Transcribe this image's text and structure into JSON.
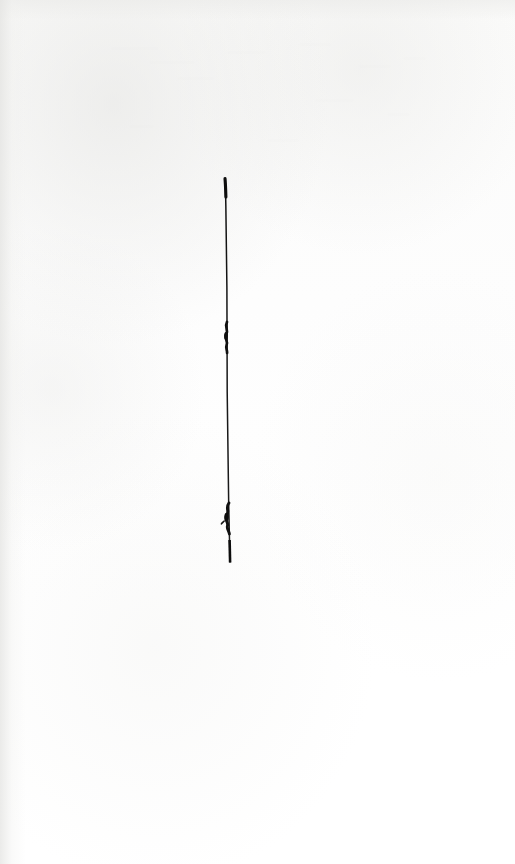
{
  "page": {
    "width_px": 515,
    "height_px": 864,
    "background_color": "#fdfdfc",
    "paper_tone": "off-white",
    "visible_text": ""
  },
  "artwork": {
    "name": "vertical-ink-stroke",
    "description": "A single near-vertical hand-drawn ink line",
    "ink_color": "#141414",
    "stroke": {
      "top_y": 178,
      "bottom_y": 563,
      "top_x": 225,
      "bottom_x": 230,
      "length_px": 385,
      "min_width_px": 1,
      "max_width_px": 3
    },
    "blobs": [
      {
        "name": "upper-ink-blob",
        "x": 226,
        "y": 328,
        "width_px": 6,
        "height_px": 26
      },
      {
        "name": "lower-ink-blob",
        "x": 228,
        "y": 512,
        "width_px": 7,
        "height_px": 24
      }
    ]
  },
  "showthrough": {
    "description": "Faint bleed-through from the reverse side of the sheet",
    "marks": [
      {
        "x": 112,
        "y": 44,
        "size_px": 7,
        "text": "—  ——   ———"
      },
      {
        "x": 150,
        "y": 58,
        "size_px": 7,
        "text": "————  ——"
      },
      {
        "x": 228,
        "y": 48,
        "size_px": 7,
        "text": "——  ———"
      },
      {
        "x": 300,
        "y": 40,
        "size_px": 7,
        "text": "———  —"
      },
      {
        "x": 360,
        "y": 62,
        "size_px": 7,
        "text": "——  ——"
      },
      {
        "x": 404,
        "y": 54,
        "size_px": 7,
        "text": "———"
      },
      {
        "x": 178,
        "y": 74,
        "size_px": 7,
        "text": "—————"
      },
      {
        "x": 316,
        "y": 96,
        "size_px": 7,
        "text": "——  ———"
      },
      {
        "x": 388,
        "y": 110,
        "size_px": 7,
        "text": "———"
      },
      {
        "x": 130,
        "y": 122,
        "size_px": 7,
        "text": "—  ——"
      },
      {
        "x": 268,
        "y": 136,
        "size_px": 7,
        "text": "———  —"
      }
    ]
  }
}
